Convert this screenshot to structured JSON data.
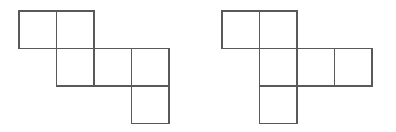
{
  "figure": {
    "background_color": "#ffffff",
    "line_color": "#595959",
    "fill_color": "#ffffff",
    "line_width": 1.4,
    "cell_size": 37.5,
    "canvas": {
      "width": 396,
      "height": 132
    },
    "nets": [
      {
        "name": "left-net",
        "label": "Net A",
        "origin": {
          "x": 19,
          "y": 11
        },
        "grid_columns": 4,
        "grid_rows": 3,
        "square_count": 6,
        "shape_type": "staircase",
        "cells": [
          {
            "col": 0,
            "row": 0,
            "name": "cell-c0-r0"
          },
          {
            "col": 1,
            "row": 0,
            "name": "cell-c1-r0"
          },
          {
            "col": 1,
            "row": 1,
            "name": "cell-c1-r1"
          },
          {
            "col": 2,
            "row": 1,
            "name": "cell-c2-r1"
          },
          {
            "col": 3,
            "row": 1,
            "name": "cell-c3-r1"
          },
          {
            "col": 3,
            "row": 2,
            "name": "cell-c3-r2"
          }
        ]
      },
      {
        "name": "right-net",
        "label": "Net B",
        "origin": {
          "x": 222,
          "y": 11
        },
        "grid_columns": 4,
        "grid_rows": 3,
        "square_count": 6,
        "shape_type": "cross",
        "cells": [
          {
            "col": 0,
            "row": 0,
            "name": "cell-c0-r0"
          },
          {
            "col": 1,
            "row": 0,
            "name": "cell-c1-r0"
          },
          {
            "col": 1,
            "row": 1,
            "name": "cell-c1-r1"
          },
          {
            "col": 2,
            "row": 1,
            "name": "cell-c2-r1"
          },
          {
            "col": 3,
            "row": 1,
            "name": "cell-c3-r1"
          },
          {
            "col": 1,
            "row": 2,
            "name": "cell-c1-r2"
          }
        ]
      }
    ]
  }
}
